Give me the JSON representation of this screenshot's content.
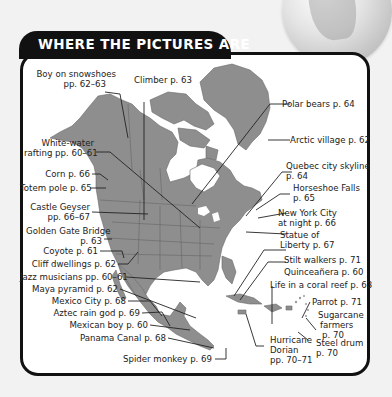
{
  "header": {
    "title": "WHERE THE PICTURES ARE"
  },
  "colors": {
    "land": "#8e8e8e",
    "border": "#5f5f5f",
    "frame": "#111111",
    "panel": "#ffffff",
    "background": "#f2f2f2"
  },
  "labels": {
    "boy_snowshoes": {
      "line1": "Boy on snowshoes",
      "line2": "pp. 62–63"
    },
    "climber": "Climber p. 63",
    "polar_bears": "Polar bears p. 64",
    "arctic_village": "Arctic village p. 62",
    "white_water": {
      "line1": "White-water",
      "line2": "rafting pp. 60–61"
    },
    "quebec": {
      "line1": "Quebec city skyline",
      "line2": "p. 64"
    },
    "corn": "Corn p. 66",
    "horseshoe": {
      "line1": "Horseshoe Falls",
      "line2": "p. 65"
    },
    "totem": "Totem pole p. 65",
    "castle_geyser": {
      "line1": "Castle Geyser",
      "line2": "pp. 66–67"
    },
    "nyc": {
      "line1": "New York City",
      "line2": "at night p. 66"
    },
    "golden_gate": {
      "line1": "Golden Gate Bridge",
      "line2": "p. 63"
    },
    "statue": {
      "line1": "Statue of",
      "line2": "Liberty p. 67"
    },
    "coyote": "Coyote p. 61",
    "stilt": "Stilt walkers p. 71",
    "cliff": "Cliff dwellings p. 62",
    "quinceanera": "Quinceañera p. 60",
    "jazz": "Jazz musicians pp. 60–61",
    "coral": "Life in a coral reef p. 63",
    "maya": "Maya pyramid p. 62",
    "parrot": "Parrot p. 71",
    "mexico_city": "Mexico City p. 68",
    "sugarcane": {
      "line1": "Sugarcane",
      "line2": "farmers",
      "line3": "p. 70"
    },
    "aztec": "Aztec rain god p. 69",
    "mexican_boy": "Mexican boy p. 60",
    "hurricane": {
      "line1": "Hurricane",
      "line2": "Dorian",
      "line3": "pp. 70–71"
    },
    "steel_drum": {
      "line1": "Steel drum",
      "line2": "p. 70"
    },
    "panama": "Panama Canal p. 68",
    "spider_monkey": "Spider monkey p. 69"
  }
}
